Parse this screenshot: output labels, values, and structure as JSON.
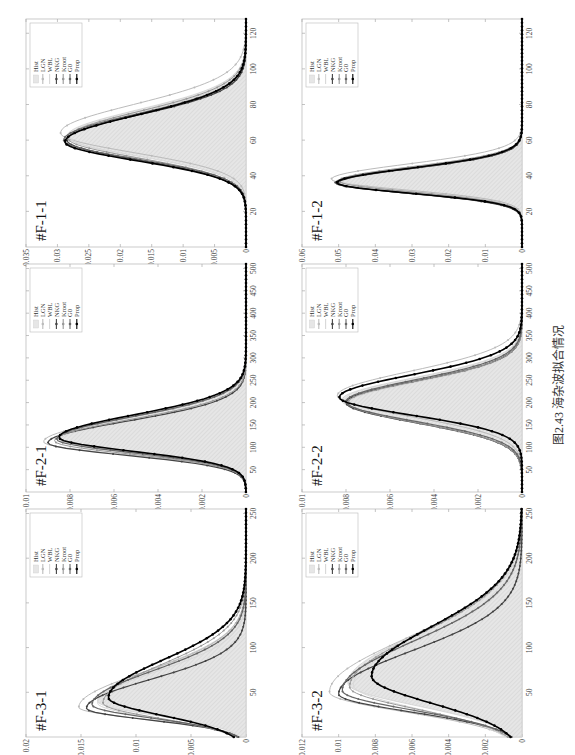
{
  "figure": {
    "caption": "图2.43   海杂波拟合情况",
    "legend_entries": [
      "Hist",
      "LGN",
      "WBL",
      "NKG",
      "Kroot",
      "G0",
      "Prop"
    ]
  },
  "chart_data": [
    {
      "id": "F-1-1",
      "title": "#F-1-1",
      "type": "line",
      "x_ticks": [
        20,
        40,
        60,
        80,
        100,
        120
      ],
      "xlim": [
        0,
        128
      ],
      "y_ticks": [
        0,
        0.005,
        0.01,
        0.015,
        0.02,
        0.025,
        0.03,
        0.035
      ],
      "ylim": [
        0,
        0.035
      ],
      "y_tick_labels": [
        "0",
        "0.005",
        "0.01",
        "0.015",
        "0.02",
        "0.025",
        "0.03",
        "0.035"
      ],
      "hist": {
        "peak_x": 62,
        "peak_y": 0.0285,
        "sigma_left": 11,
        "sigma_right": 15
      },
      "series": [
        {
          "name": "LGN",
          "peak_x": 64,
          "peak_y": 0.0295,
          "sigma_left": 11,
          "sigma_right": 16
        },
        {
          "name": "WBL",
          "peak_x": 62,
          "peak_y": 0.028,
          "sigma_left": 12,
          "sigma_right": 14
        },
        {
          "name": "NKG",
          "peak_x": 60,
          "peak_y": 0.0285,
          "sigma_left": 11,
          "sigma_right": 14
        },
        {
          "name": "Kroot",
          "peak_x": 61,
          "peak_y": 0.0283,
          "sigma_left": 11,
          "sigma_right": 15
        },
        {
          "name": "G0",
          "peak_x": 60,
          "peak_y": 0.029,
          "sigma_left": 10.5,
          "sigma_right": 14.5
        },
        {
          "name": "Prop",
          "peak_x": 59,
          "peak_y": 0.0288,
          "sigma_left": 10.5,
          "sigma_right": 15
        }
      ]
    },
    {
      "id": "F-1-2",
      "title": "#F-1-2",
      "type": "line",
      "x_ticks": [
        20,
        40,
        60,
        80,
        100,
        120
      ],
      "xlim": [
        0,
        128
      ],
      "y_ticks": [
        0,
        0.01,
        0.02,
        0.03,
        0.04,
        0.05,
        0.06
      ],
      "ylim": [
        0,
        0.06
      ],
      "y_tick_labels": [
        "0",
        "0.01",
        "0.02",
        "0.03",
        "0.04",
        "0.05",
        "0.06"
      ],
      "hist": {
        "peak_x": 37,
        "peak_y": 0.05,
        "sigma_left": 6,
        "sigma_right": 8
      },
      "series": [
        {
          "name": "LGN",
          "peak_x": 38,
          "peak_y": 0.052,
          "sigma_left": 6,
          "sigma_right": 8.5
        },
        {
          "name": "WBL",
          "peak_x": 37,
          "peak_y": 0.049,
          "sigma_left": 6.5,
          "sigma_right": 7.5
        },
        {
          "name": "NKG",
          "peak_x": 36,
          "peak_y": 0.05,
          "sigma_left": 6,
          "sigma_right": 8
        },
        {
          "name": "Kroot",
          "peak_x": 37,
          "peak_y": 0.05,
          "sigma_left": 6,
          "sigma_right": 8
        },
        {
          "name": "G0",
          "peak_x": 36,
          "peak_y": 0.051,
          "sigma_left": 5.8,
          "sigma_right": 8
        },
        {
          "name": "Prop",
          "peak_x": 36,
          "peak_y": 0.0505,
          "sigma_left": 5.8,
          "sigma_right": 8.2
        }
      ]
    },
    {
      "id": "F-2-1",
      "title": "#F-2-1",
      "type": "line",
      "x_ticks": [
        50,
        100,
        150,
        200,
        250,
        300,
        350,
        400,
        450,
        500
      ],
      "xlim": [
        0,
        510
      ],
      "y_ticks": [
        0,
        0.002,
        0.004,
        0.006,
        0.008,
        0.01
      ],
      "ylim": [
        0,
        0.01
      ],
      "y_tick_labels": [
        "0",
        "0.002",
        "0.004",
        "0.006",
        "0.008",
        "0.01"
      ],
      "hist": {
        "peak_x": 118,
        "peak_y": 0.0085,
        "sigma_left": 30,
        "sigma_right": 50
      },
      "series": [
        {
          "name": "LGN",
          "peak_x": 112,
          "peak_y": 0.0092,
          "sigma_left": 28,
          "sigma_right": 52
        },
        {
          "name": "WBL",
          "peak_x": 118,
          "peak_y": 0.0084,
          "sigma_left": 32,
          "sigma_right": 46
        },
        {
          "name": "NKG",
          "peak_x": 110,
          "peak_y": 0.009,
          "sigma_left": 28,
          "sigma_right": 48
        },
        {
          "name": "Kroot",
          "peak_x": 114,
          "peak_y": 0.0087,
          "sigma_left": 29,
          "sigma_right": 48
        },
        {
          "name": "G0",
          "peak_x": 118,
          "peak_y": 0.0086,
          "sigma_left": 30,
          "sigma_right": 50
        },
        {
          "name": "Prop",
          "peak_x": 122,
          "peak_y": 0.0085,
          "sigma_left": 31,
          "sigma_right": 50
        }
      ]
    },
    {
      "id": "F-2-2",
      "title": "#F-2-2",
      "type": "line",
      "x_ticks": [
        50,
        100,
        150,
        200,
        250,
        300,
        350,
        400,
        450,
        500
      ],
      "xlim": [
        0,
        510
      ],
      "y_ticks": [
        0,
        0.002,
        0.004,
        0.006,
        0.008,
        0.01
      ],
      "ylim": [
        0,
        0.01
      ],
      "y_tick_labels": [
        "0",
        "0.002",
        "0.004",
        "0.006",
        "0.008",
        "0.01"
      ],
      "hist": {
        "peak_x": 205,
        "peak_y": 0.0082,
        "sigma_left": 45,
        "sigma_right": 50
      },
      "series": [
        {
          "name": "LGN",
          "peak_x": 215,
          "peak_y": 0.0084,
          "sigma_left": 46,
          "sigma_right": 55
        },
        {
          "name": "WBL",
          "peak_x": 198,
          "peak_y": 0.0079,
          "sigma_left": 44,
          "sigma_right": 48
        },
        {
          "name": "NKG",
          "peak_x": 200,
          "peak_y": 0.008,
          "sigma_left": 45,
          "sigma_right": 48
        },
        {
          "name": "Kroot",
          "peak_x": 200,
          "peak_y": 0.0079,
          "sigma_left": 45,
          "sigma_right": 48
        },
        {
          "name": "G0",
          "peak_x": 202,
          "peak_y": 0.008,
          "sigma_left": 44,
          "sigma_right": 49
        },
        {
          "name": "Prop",
          "peak_x": 212,
          "peak_y": 0.0083,
          "sigma_left": 40,
          "sigma_right": 50
        }
      ]
    },
    {
      "id": "F-3-1",
      "title": "#F-3-1",
      "type": "line",
      "x_ticks": [
        50,
        100,
        150,
        200,
        250
      ],
      "xlim": [
        0,
        255
      ],
      "y_ticks": [
        0,
        0.005,
        0.01,
        0.015,
        0.02
      ],
      "ylim": [
        0,
        0.02
      ],
      "y_tick_labels": [
        "0",
        "0.005",
        "0.01",
        "0.015",
        "0.02"
      ],
      "hist": {
        "peak_x": 40,
        "peak_y": 0.0135,
        "sigma_left": 16,
        "sigma_right": 38
      },
      "series": [
        {
          "name": "LGN",
          "peak_x": 33,
          "peak_y": 0.0152,
          "sigma_left": 13,
          "sigma_right": 40
        },
        {
          "name": "WBL",
          "peak_x": 38,
          "peak_y": 0.0135,
          "sigma_left": 17,
          "sigma_right": 35
        },
        {
          "name": "NKG",
          "peak_x": 32,
          "peak_y": 0.0145,
          "sigma_left": 13,
          "sigma_right": 32
        },
        {
          "name": "Kroot",
          "peak_x": 38,
          "peak_y": 0.013,
          "sigma_left": 17,
          "sigma_right": 42
        },
        {
          "name": "G0",
          "peak_x": 36,
          "peak_y": 0.014,
          "sigma_left": 15,
          "sigma_right": 38
        },
        {
          "name": "Prop",
          "peak_x": 44,
          "peak_y": 0.0125,
          "sigma_left": 20,
          "sigma_right": 42
        }
      ]
    },
    {
      "id": "F-3-2",
      "title": "#F-3-2",
      "type": "line",
      "x_ticks": [
        50,
        100,
        150,
        200,
        250
      ],
      "xlim": [
        0,
        255
      ],
      "y_ticks": [
        0,
        0.002,
        0.004,
        0.006,
        0.008,
        0.01,
        0.012
      ],
      "ylim": [
        0,
        0.012
      ],
      "y_tick_labels": [
        "0",
        "0.002",
        "0.004",
        "0.006",
        "0.008",
        "0.01",
        "0.012"
      ],
      "hist": {
        "peak_x": 60,
        "peak_y": 0.0095,
        "sigma_left": 25,
        "sigma_right": 55
      },
      "series": [
        {
          "name": "LGN",
          "peak_x": 50,
          "peak_y": 0.0105,
          "sigma_left": 22,
          "sigma_right": 60
        },
        {
          "name": "WBL",
          "peak_x": 58,
          "peak_y": 0.0092,
          "sigma_left": 27,
          "sigma_right": 52
        },
        {
          "name": "NKG",
          "peak_x": 48,
          "peak_y": 0.01,
          "sigma_left": 20,
          "sigma_right": 48
        },
        {
          "name": "Kroot",
          "peak_x": 56,
          "peak_y": 0.0094,
          "sigma_left": 25,
          "sigma_right": 58
        },
        {
          "name": "G0",
          "peak_x": 52,
          "peak_y": 0.0098,
          "sigma_left": 22,
          "sigma_right": 55
        },
        {
          "name": "Prop",
          "peak_x": 68,
          "peak_y": 0.0082,
          "sigma_left": 30,
          "sigma_right": 55
        }
      ]
    }
  ],
  "styles": {
    "hist_fill": "#e6e6e6",
    "hist_stroke": "#c8c8c8",
    "series_colors": {
      "LGN": "#bbbbbb",
      "WBL": "#d8d8d8",
      "NKG": "#444444",
      "Kroot": "#999999",
      "G0": "#666666",
      "Prop": "#000000"
    }
  }
}
